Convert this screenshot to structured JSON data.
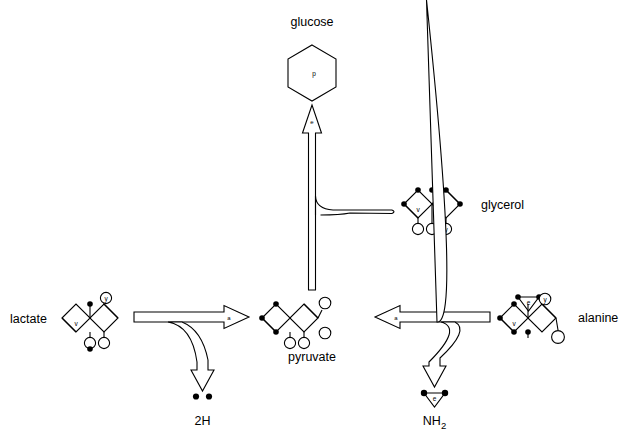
{
  "figure": {
    "background_color": "#ffffff",
    "stroke_color": "#000000",
    "width": 624,
    "height": 444
  },
  "labels": {
    "glucose": "glucose",
    "glycerol": "glycerol",
    "lactate": "lactate",
    "pyruvate": "pyruvate",
    "alanine": "alanine",
    "two_h": "2H",
    "nh2_n": "NH",
    "nh2_sub": "2"
  },
  "glyph_marks": {
    "glucose_ring": "p",
    "glucose_arrow": "e",
    "lactate_to_pyruvate_arrow": "a",
    "alanine_to_pyruvate_arrow": "a",
    "lactate_diamond": "v",
    "lactate_circle": "y",
    "glycerol_diamond": "v",
    "glycerol_circle": "y",
    "alanine_diamond": "v",
    "alanine_triangle": "e",
    "alanine_circle": "y",
    "nh2_triangle": "e"
  },
  "molecules": [
    {
      "name": "lactate",
      "label": "lactate",
      "label_side": "left",
      "diamonds": 3,
      "description": "three fused diamonds with open left diamond marked v, filled top node, circled y upper right, and two lower circles"
    },
    {
      "name": "pyruvate",
      "label": "pyruvate",
      "label_side": "below",
      "diamonds": 3,
      "description": "three fused diamonds with filled nodes on the left and open circles on the right and bottom"
    },
    {
      "name": "glycerol",
      "label": "glycerol",
      "label_side": "right",
      "diamonds": 3,
      "description": "three fused diamonds with filled top nodes and three open circles below, rightmost circle marked y"
    },
    {
      "name": "alanine",
      "label": "alanine",
      "label_side": "right",
      "diamonds": 3,
      "description": "three fused diamonds with an inverted triangle marked e on top, circled y upper right and open circle lower right"
    }
  ],
  "arrows": [
    {
      "name": "lactate-to-pyruvate",
      "from": "lactate",
      "to": "pyruvate",
      "direction": "right",
      "mark": "a",
      "branch": {
        "to": "2H",
        "direction": "down"
      }
    },
    {
      "name": "alanine-to-pyruvate",
      "from": "alanine",
      "to": "pyruvate",
      "direction": "left",
      "mark": "a",
      "branch": {
        "to": "NH2",
        "direction": "down"
      }
    },
    {
      "name": "pyruvate-to-glucose",
      "from": "pyruvate",
      "to": "glucose",
      "direction": "up",
      "mark": "e",
      "merge": {
        "from": "glycerol",
        "direction": "left"
      }
    }
  ],
  "byproducts": [
    {
      "name": "2H",
      "label": "2H",
      "dots": 2
    },
    {
      "name": "NH2",
      "label": "NH2",
      "mark": "e"
    }
  ]
}
